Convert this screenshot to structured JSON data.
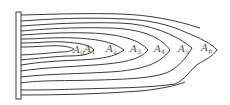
{
  "diagram": {
    "stroke_color": "#3a3a3a",
    "labels": [
      {
        "base": "A",
        "sub": "0",
        "x": 73,
        "y": 45
      },
      {
        "base": "A",
        "sub": "1",
        "x": 84,
        "y": 44
      },
      {
        "base": "A",
        "sub": "2",
        "x": 106,
        "y": 44
      },
      {
        "base": "A",
        "sub": "3",
        "x": 130,
        "y": 44
      },
      {
        "base": "A",
        "sub": "4",
        "x": 154,
        "y": 44
      },
      {
        "base": "A",
        "sub": "5",
        "x": 178,
        "y": 44
      },
      {
        "base": "A",
        "sub": "n",
        "x": 201,
        "y": 43
      }
    ]
  }
}
